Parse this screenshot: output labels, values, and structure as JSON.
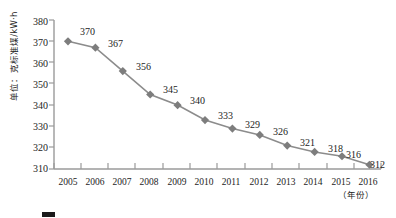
{
  "chart_data": {
    "type": "line",
    "title": "",
    "subtitle": "",
    "xlabel": "（年份）",
    "ylabel": "单位：克标准煤/kW·h",
    "categories": [
      "2005",
      "2006",
      "2007",
      "2008",
      "2009",
      "2010",
      "2011",
      "2012",
      "2013",
      "2014",
      "2015",
      "2016"
    ],
    "values": [
      370,
      367,
      356,
      345,
      340,
      333,
      329,
      326,
      321,
      318,
      316,
      312
    ],
    "point_labels": [
      "370",
      "367",
      "356",
      "345",
      "340",
      "333",
      "329",
      "326",
      "321",
      "318",
      "316",
      "312"
    ],
    "ylim": [
      310,
      380
    ],
    "yticks": [
      310,
      320,
      330,
      340,
      350,
      360,
      370,
      380
    ],
    "ytick_labels": [
      "310",
      "320",
      "330",
      "340",
      "350",
      "360",
      "370",
      "380"
    ],
    "grid": false,
    "legend": "none",
    "series_name": "供电标准煤耗",
    "marker": "diamond",
    "line_color": "#8c8c8c",
    "marker_color": "#7d7d7d",
    "axis_color": "#9a9a9a",
    "text_color": "#1c1c1c"
  },
  "caption": {
    "fragment": ""
  }
}
